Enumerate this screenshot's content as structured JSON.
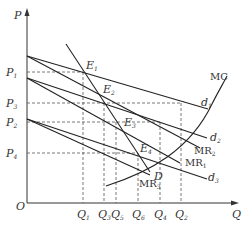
{
  "diagram": {
    "type": "economics-price-quantity",
    "axes": {
      "y_label": "P",
      "x_label": "Q",
      "origin_label": "O"
    },
    "price_ticks": [
      {
        "main": "P",
        "sub": "1"
      },
      {
        "main": "P",
        "sub": "3"
      },
      {
        "main": "P",
        "sub": "2"
      },
      {
        "main": "P",
        "sub": "4"
      }
    ],
    "quantity_ticks": [
      {
        "main": "Q",
        "sub": "1"
      },
      {
        "main": "Q",
        "sub": "3"
      },
      {
        "main": "Q",
        "sub": "5"
      },
      {
        "main": "Q",
        "sub": "6"
      },
      {
        "main": "Q",
        "sub": "4"
      },
      {
        "main": "Q",
        "sub": "2"
      }
    ],
    "curves": {
      "mc": "MC",
      "d1": {
        "main": "d",
        "sub": "1"
      },
      "d2": {
        "main": "d",
        "sub": "2"
      },
      "d3": {
        "main": "d",
        "sub": "3"
      },
      "mr1": {
        "main": "MR",
        "sub": "1"
      },
      "mr2": {
        "main": "MR",
        "sub": "2"
      },
      "mr3": {
        "main": "MR",
        "sub": "3"
      },
      "D": "D"
    },
    "points": [
      {
        "main": "E",
        "sub": "1"
      },
      {
        "main": "E",
        "sub": "2"
      },
      {
        "main": "E",
        "sub": "3"
      },
      {
        "main": "E",
        "sub": "4"
      }
    ]
  }
}
